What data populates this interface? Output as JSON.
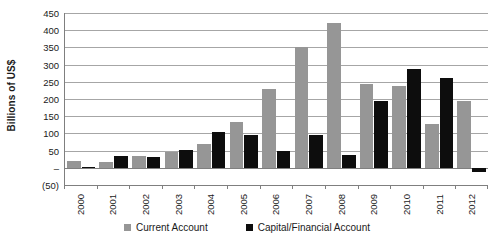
{
  "chart_data": {
    "type": "bar",
    "title": "",
    "xlabel": "",
    "ylabel": "Billions of US$",
    "categories": [
      "2000",
      "2001",
      "2002",
      "2003",
      "2004",
      "2005",
      "2006",
      "2007",
      "2008",
      "2009",
      "2010",
      "2011",
      "2012"
    ],
    "series": [
      {
        "name": "Current Account",
        "color": "#969696",
        "values": [
          20,
          17,
          35,
          45,
          68,
          132,
          230,
          352,
          420,
          243,
          238,
          128,
          193
        ]
      },
      {
        "name": "Capital/Financial Account",
        "color": "#0d0d0d",
        "values": [
          2,
          35,
          32,
          52,
          105,
          95,
          50,
          95,
          38,
          195,
          288,
          260,
          -12
        ]
      }
    ],
    "ylim": [
      -50,
      450
    ],
    "ytick_values": [
      450,
      400,
      350,
      300,
      250,
      200,
      150,
      100,
      50,
      0,
      -50
    ],
    "ytick_labels": [
      "450",
      "400",
      "350",
      "300",
      "250",
      "200",
      "150",
      "100",
      "50",
      "–",
      "(50)"
    ],
    "grid": true,
    "legend_position": "bottom"
  }
}
